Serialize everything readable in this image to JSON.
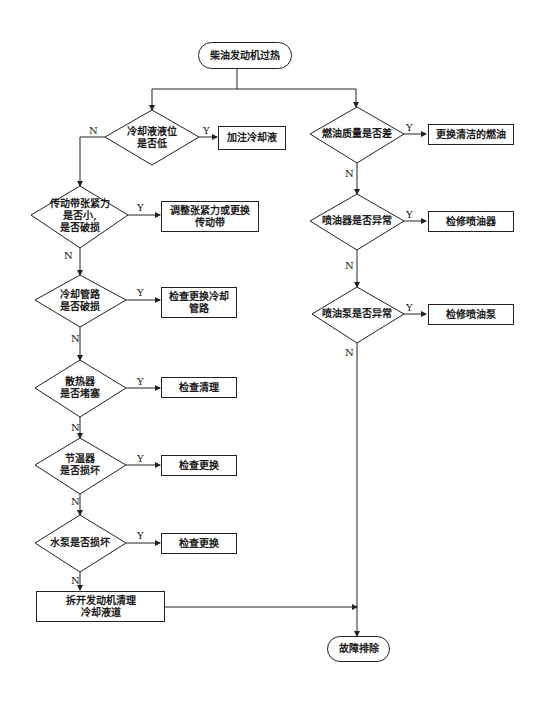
{
  "title": "柴油发动机过热",
  "end": "故障排除",
  "left_branch": [
    {
      "question": "冷却液液位\n是否低",
      "yes_action": "加注冷却液"
    },
    {
      "question": "传动带张紧力\n是否小,\n是否破损",
      "yes_action": "调整张紧力或更换\n传动带"
    },
    {
      "question": "冷却管路\n是否破损",
      "yes_action": "检查更换冷却\n管路"
    },
    {
      "question": "散热器\n是否堵塞",
      "yes_action": "检查清理"
    },
    {
      "question": "节温器\n是否损坏",
      "yes_action": "检查更换"
    },
    {
      "question": "水泵是否损坏",
      "yes_action": "检查更换"
    }
  ],
  "left_final_action": "拆开发动机清理\n冷却液道",
  "right_branch": [
    {
      "question": "燃油质量是否差",
      "yes_action": "更换清洁的燃油"
    },
    {
      "question": "喷油器是否异常",
      "yes_action": "检修喷油器"
    },
    {
      "question": "喷油泵是否异常",
      "yes_action": "检修喷油泵"
    }
  ],
  "labels": {
    "yes": "Y",
    "no": "N"
  }
}
